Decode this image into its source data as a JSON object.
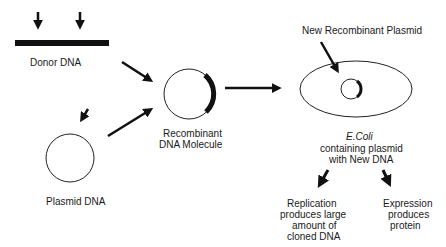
{
  "labels": {
    "donor_dna": "Donor DNA",
    "plasmid_dna": "Plasmid DNA",
    "recombinant_line1": "Recombinant",
    "recombinant_line2": "DNA Molecule",
    "new_recombinant_plasmid": "New Recombinant Plasmid",
    "ecoli_name": "E.Coli",
    "ecoli_line2": "containing plasmid",
    "ecoli_line3": "with New DNA",
    "replication_line1": "Replication",
    "replication_line2": "produces large",
    "replication_line3": "amount of",
    "replication_line4": "cloned DNA",
    "expression_line1": "Expression",
    "expression_line2": "produces",
    "expression_line3": "protein"
  },
  "colors": {
    "ink": "#111111",
    "background": "#ffffff"
  }
}
